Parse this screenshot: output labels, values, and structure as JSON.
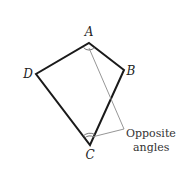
{
  "diagram": {
    "title": "",
    "shape": "quadrilateral",
    "vertices": [
      {
        "id": "A",
        "label": "A",
        "x": 89,
        "y": 43,
        "label_x": 89,
        "label_y": 36
      },
      {
        "id": "B",
        "label": "B",
        "x": 124,
        "y": 70,
        "label_x": 131,
        "label_y": 75
      },
      {
        "id": "C",
        "label": "C",
        "x": 90,
        "y": 145,
        "label_x": 90,
        "label_y": 158
      },
      {
        "id": "D",
        "label": "D",
        "x": 36,
        "y": 74,
        "label_x": 28,
        "label_y": 78
      }
    ],
    "annotation": {
      "line1": "Opposite",
      "line2": "angles",
      "anchor_x": 124,
      "anchor_y": 129
    },
    "colors": {
      "edge": "#1a1a1a",
      "pointer": "#8a8a8a",
      "text": "#222222"
    }
  }
}
